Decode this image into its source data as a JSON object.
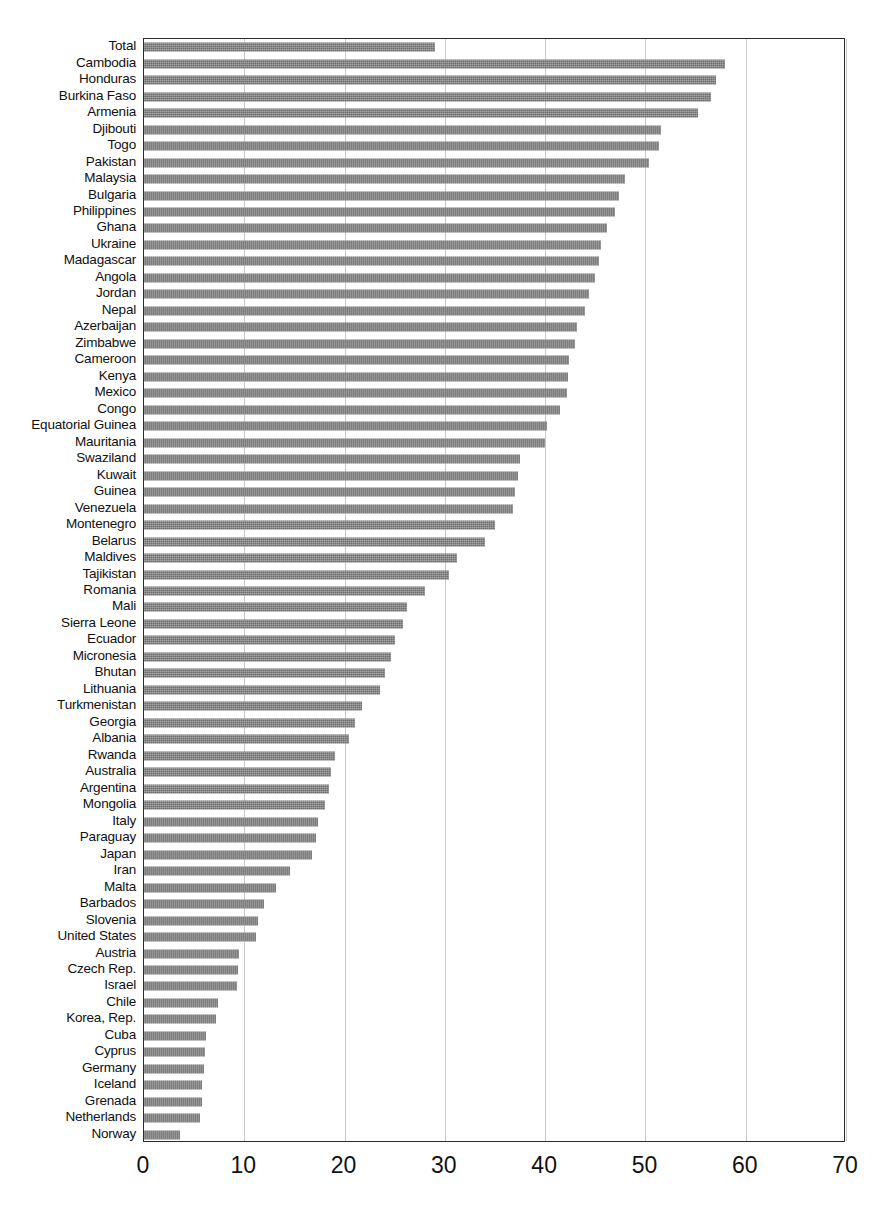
{
  "chart_data": {
    "type": "bar",
    "orientation": "horizontal",
    "title": "",
    "subtitle": "",
    "xlabel": "",
    "ylabel": "",
    "xlim": [
      0,
      70
    ],
    "ylim": null,
    "xticks": [
      0,
      10,
      20,
      30,
      40,
      50,
      60,
      70
    ],
    "xtick_labels": [
      "0",
      "10",
      "20",
      "30",
      "40",
      "50",
      "60",
      "70"
    ],
    "grid": "vertical",
    "legend": null,
    "bar_color": "#6e6e6e",
    "categories": [
      "Total",
      "Cambodia",
      "Honduras",
      "Burkina Faso",
      "Armenia",
      "Djibouti",
      "Togo",
      "Pakistan",
      "Malaysia",
      "Bulgaria",
      "Philippines",
      "Ghana",
      "Ukraine",
      "Madagascar",
      "Angola",
      "Jordan",
      "Nepal",
      "Azerbaijan",
      "Zimbabwe",
      "Cameroon",
      "Kenya",
      "Mexico",
      "Congo",
      "Equatorial Guinea",
      "Mauritania",
      "Swaziland",
      "Kuwait",
      "Guinea",
      "Venezuela",
      "Montenegro",
      "Belarus",
      "Maldives",
      "Tajikistan",
      "Romania",
      "Mali",
      "Sierra Leone",
      "Ecuador",
      "Micronesia",
      "Bhutan",
      "Lithuania",
      "Turkmenistan",
      "Georgia",
      "Albania",
      "Rwanda",
      "Australia",
      "Argentina",
      "Mongolia",
      "Italy",
      "Paraguay",
      "Japan",
      "Iran",
      "Malta",
      "Barbados",
      "Slovenia",
      "United States",
      "Austria",
      "Czech Rep.",
      "Israel",
      "Chile",
      "Korea, Rep.",
      "Cuba",
      "Cyprus",
      "Germany",
      "Iceland",
      "Grenada",
      "Netherlands",
      "Norway"
    ],
    "values": [
      29.0,
      57.9,
      57.0,
      56.5,
      55.2,
      51.6,
      51.4,
      50.4,
      48.0,
      47.4,
      47.0,
      46.2,
      45.6,
      45.4,
      45.0,
      44.4,
      44.0,
      43.2,
      43.0,
      42.4,
      42.3,
      42.2,
      41.5,
      40.2,
      40.0,
      37.5,
      37.3,
      37.0,
      36.8,
      35.0,
      34.0,
      31.2,
      30.4,
      28.0,
      26.2,
      25.8,
      25.0,
      24.6,
      24.0,
      23.5,
      21.7,
      21.0,
      20.4,
      19.0,
      18.6,
      18.4,
      18.0,
      17.4,
      17.2,
      16.8,
      14.6,
      13.2,
      12.0,
      11.4,
      11.2,
      9.5,
      9.4,
      9.3,
      7.4,
      7.2,
      6.2,
      6.1,
      6.0,
      5.8,
      5.8,
      5.6,
      3.6
    ]
  }
}
